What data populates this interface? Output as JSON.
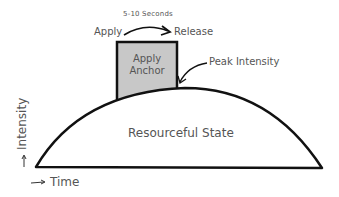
{
  "diagram": {
    "duration_label": "5-10 Seconds",
    "apply_label": "Apply",
    "release_label": "Release",
    "box_label_line1": "Apply",
    "box_label_line2": "Anchor",
    "peak_label": "Peak Intensity",
    "state_label": "Resourceful State",
    "y_axis_label": "Intensity",
    "x_axis_label": "Time",
    "colors": {
      "stroke": "#111111",
      "box_fill": "#c8c8c8",
      "text": "#555555"
    }
  }
}
